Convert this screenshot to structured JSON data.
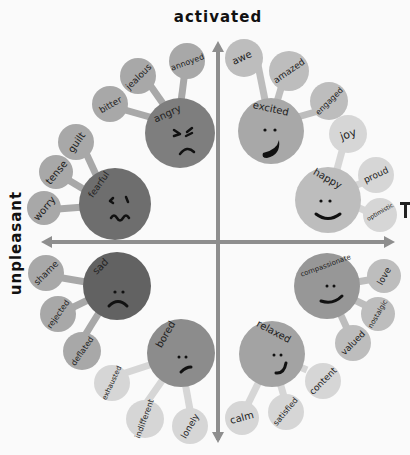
{
  "axes": {
    "top": "activated",
    "left": "unpleasant",
    "right_partial": "pleasant"
  },
  "colors": {
    "axis": "#8e8e8e",
    "angry": "#7e7e7e",
    "fearful": "#6e6e6e",
    "sad": "#626262",
    "bored": "#8c8c8c",
    "excited": "#a8a8a8",
    "happy": "#bdbdbd",
    "compassionate": "#979797",
    "relaxed": "#a3a3a3",
    "sub_dark": "#a8a8a8",
    "sub_mid": "#bdbdbd",
    "sub_light": "#d6d6d6"
  },
  "clusters": [
    {
      "name": "angry",
      "face": "angry",
      "children": [
        "bitter",
        "jealous",
        "annoyed"
      ]
    },
    {
      "name": "fearful",
      "face": "fearful",
      "children": [
        "worry",
        "tense",
        "guilt"
      ]
    },
    {
      "name": "excited",
      "face": "big-smile",
      "children": [
        "awe",
        "amazed",
        "engaged"
      ]
    },
    {
      "name": "happy",
      "face": "smile",
      "children": [
        "joy",
        "proud",
        "optimistic"
      ]
    },
    {
      "name": "sad",
      "face": "frown",
      "children": [
        "shame",
        "rejected",
        "deflated"
      ]
    },
    {
      "name": "bored",
      "face": "meh",
      "children": [
        "exhausted",
        "indifferent",
        "lonely"
      ]
    },
    {
      "name": "compassionate",
      "face": "smile",
      "children": [
        "love",
        "nostalgic",
        "valued"
      ]
    },
    {
      "name": "relaxed",
      "face": "smile",
      "children": [
        "calm",
        "satisfied",
        "content"
      ]
    }
  ],
  "labels": {
    "angry": "angry",
    "bitter": "bitter",
    "jealous": "jealous",
    "annoyed": "annoyed",
    "fearful": "fearful",
    "worry": "worry",
    "tense": "tense",
    "guilt": "guilt",
    "excited": "excited",
    "awe": "awe",
    "amazed": "amazed",
    "engaged": "engaged",
    "happy": "happy",
    "joy": "joy",
    "proud": "proud",
    "optimistic": "optimistic",
    "sad": "sad",
    "shame": "shame",
    "rejected": "rejected",
    "deflated": "deflated",
    "bored": "bored",
    "exhausted": "exhausted",
    "indifferent": "indifferent",
    "lonely": "lonely",
    "compassionate": "compassionate",
    "love": "love",
    "nostalgic": "nostalgic",
    "valued": "valued",
    "relaxed": "relaxed",
    "calm": "calm",
    "satisfied": "satisfied",
    "content": "content"
  }
}
